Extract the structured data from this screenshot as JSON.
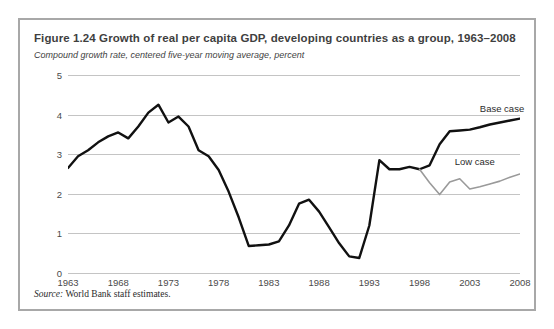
{
  "figure": {
    "title": "Figure 1.24  Growth of real per capita GDP, developing countries as a group, 1963–2008",
    "subtitle": "Compound growth rate, centered five-year moving average, percent",
    "source_word": "Source:",
    "source_text": " World Bank staff estimates."
  },
  "colors": {
    "base_case_line": "#111111",
    "low_case_line": "#9a9a9a",
    "gridline": "#c4c4c4",
    "frame_border": "#a8a8a8",
    "text": "#3f3f3f",
    "background": "#ffffff"
  },
  "chart_data": {
    "type": "line",
    "title": "Figure 1.24  Growth of real per capita GDP, developing countries as a group, 1963–2008",
    "subtitle": "Compound growth rate, centered five-year moving average, percent",
    "xlabel": "",
    "ylabel": "",
    "xlim": [
      1963,
      2008
    ],
    "ylim": [
      0,
      5
    ],
    "grid": true,
    "legend_position": "inline-right",
    "ytick_labels": [
      "0",
      "1",
      "2",
      "3",
      "4",
      "5"
    ],
    "ytick_values": [
      0,
      1,
      2,
      3,
      4,
      5
    ],
    "xtick_labels": [
      "1963",
      "1968",
      "1973",
      "1978",
      "1983",
      "1988",
      "1993",
      "1998",
      "2003",
      "2008"
    ],
    "xtick_values": [
      1963,
      1968,
      1973,
      1978,
      1983,
      1988,
      1993,
      1998,
      2003,
      2008
    ],
    "series": [
      {
        "name": "Base case",
        "color": "#111111",
        "width": 2.4,
        "x": [
          1963,
          1964,
          1965,
          1966,
          1967,
          1968,
          1969,
          1970,
          1971,
          1972,
          1973,
          1974,
          1975,
          1976,
          1977,
          1978,
          1979,
          1980,
          1981,
          1982,
          1983,
          1984,
          1985,
          1986,
          1987,
          1988,
          1989,
          1990,
          1991,
          1992,
          1993,
          1994,
          1995,
          1996,
          1997,
          1998,
          1999,
          2000,
          2001,
          2002,
          2003,
          2004,
          2005,
          2006,
          2007,
          2008
        ],
        "values": [
          2.65,
          2.95,
          3.1,
          3.3,
          3.45,
          3.55,
          3.4,
          3.7,
          4.05,
          4.25,
          3.8,
          3.95,
          3.7,
          3.1,
          2.95,
          2.6,
          2.05,
          1.4,
          0.68,
          0.7,
          0.72,
          0.8,
          1.2,
          1.75,
          1.85,
          1.55,
          1.15,
          0.75,
          0.42,
          0.38,
          1.2,
          2.85,
          2.62,
          2.62,
          2.68,
          2.62,
          2.72,
          3.25,
          3.58,
          3.6,
          3.62,
          3.68,
          3.75,
          3.8,
          3.85,
          3.9
        ]
      },
      {
        "name": "Low case",
        "color": "#9a9a9a",
        "width": 1.6,
        "x": [
          1998,
          1999,
          2000,
          2001,
          2002,
          2003,
          2004,
          2005,
          2006,
          2007,
          2008
        ],
        "values": [
          2.62,
          2.28,
          1.98,
          2.3,
          2.38,
          2.12,
          2.18,
          2.25,
          2.32,
          2.42,
          2.5
        ]
      }
    ],
    "annotations": [
      {
        "label": "Base case",
        "x": 2004,
        "y": 4.15
      },
      {
        "label": "Low case",
        "x": 2001.5,
        "y": 2.8
      }
    ]
  }
}
